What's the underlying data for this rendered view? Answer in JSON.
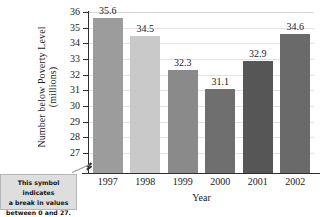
{
  "chart_data": {
    "type": "bar",
    "title": "",
    "subtitle": "",
    "xlabel": "Year",
    "ylabel_line1": "Number below Poverty Level",
    "ylabel_line2": "(millions)",
    "categories": [
      "1997",
      "1998",
      "1999",
      "2000",
      "2001",
      "2002"
    ],
    "values": [
      35.6,
      34.5,
      32.3,
      31.1,
      32.9,
      34.6
    ],
    "value_labels": [
      "35.6",
      "34.5",
      "32.3",
      "31.1",
      "32.9",
      "34.6"
    ],
    "ylim": [
      26.5,
      36
    ],
    "yticks": [
      27,
      28,
      29,
      30,
      31,
      32,
      33,
      34,
      35,
      36
    ],
    "ytick_labels": [
      "27",
      "28",
      "29",
      "30",
      "31",
      "32",
      "33",
      "34",
      "35",
      "36"
    ],
    "grid": true,
    "grid_axis": "y",
    "legend": null,
    "axis_break": {
      "present": true,
      "between": [
        0,
        27
      ]
    },
    "bar_colors": [
      "#9c9c9c",
      "#c9c9c9",
      "#8a8a8a",
      "#6f6f6f",
      "#565656",
      "#6a6a6a"
    ]
  },
  "annotation": {
    "callout_line1": "This symbol indicates",
    "callout_line2": "a break in values",
    "callout_line3": "between 0 and 27.",
    "callout_bg": "#dedede",
    "callout_border": "#b6b6b6"
  },
  "icons": {
    "axis_break_icon": "axis-break-zigzag-icon"
  }
}
